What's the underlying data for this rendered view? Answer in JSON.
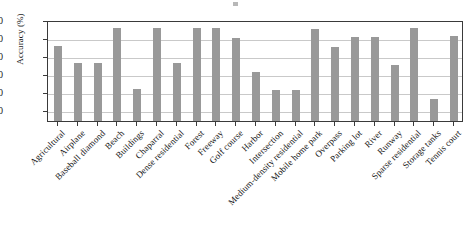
{
  "chart_data": {
    "type": "bar",
    "title": "",
    "xlabel": "",
    "ylabel": "Accuracy (%)",
    "ylim": [
      44,
      100
    ],
    "yticks": [
      50,
      60,
      70,
      80,
      90,
      100
    ],
    "grid": true,
    "legend": "none",
    "bar_color": "#999999",
    "axis_color": "#3a3a3a",
    "grid_color": "#c9c9c9",
    "categories": [
      "Agricultural",
      "Airplane",
      "Baseball diamond",
      "Beach",
      "Buildings",
      "Chaparral",
      "Dense residential",
      "Forest",
      "Freeway",
      "Golf course",
      "Harbor",
      "Intersection",
      "Medium-density residential",
      "Mobile home park",
      "Overpass",
      "Parking lot",
      "River",
      "Runway",
      "Sparse residential",
      "Storage tanks",
      "Tennis court"
    ],
    "values": [
      85.5,
      76.0,
      76.0,
      95.5,
      61.5,
      95.5,
      76.0,
      95.5,
      95.5,
      90.0,
      71.0,
      61.0,
      61.0,
      95.0,
      85.0,
      90.5,
      90.5,
      75.0,
      95.5,
      56.0,
      91.0
    ],
    "values_tail_note": ""
  }
}
